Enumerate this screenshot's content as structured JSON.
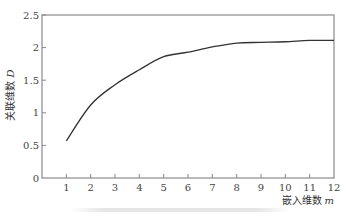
{
  "chart_data": {
    "type": "line",
    "title": "",
    "xlabel": "嵌入维数 m",
    "ylabel": "关联维数 D",
    "xlabel_text": "嵌入维数",
    "xlabel_var": "m",
    "ylabel_text": "关联维数",
    "ylabel_var": "D",
    "xlim": [
      0,
      12
    ],
    "ylim": [
      0,
      2.5
    ],
    "x_ticks": [
      1,
      2,
      3,
      4,
      5,
      6,
      7,
      8,
      9,
      10,
      11,
      12
    ],
    "x_tick_labels": [
      "1",
      "2",
      "3",
      "4",
      "5",
      "6",
      "7",
      "8",
      "9",
      "10",
      "11",
      "12"
    ],
    "y_ticks": [
      0,
      0.5,
      1,
      1.5,
      2,
      2.5
    ],
    "y_tick_labels": [
      "0",
      "0.5",
      "1",
      "1.5",
      "2",
      "2.5"
    ],
    "origin_label": "0",
    "grid": false,
    "legend": null,
    "series": [
      {
        "name": "D(m)",
        "x": [
          1,
          2,
          3,
          4,
          5,
          6,
          7,
          8,
          9,
          10,
          11,
          12
        ],
        "values": [
          0.57,
          1.12,
          1.43,
          1.66,
          1.86,
          1.93,
          2.01,
          2.07,
          2.08,
          2.09,
          2.11,
          2.11
        ],
        "color": "#333333"
      }
    ]
  },
  "style": {
    "axis_color": "#888888",
    "line_color": "#333333"
  }
}
